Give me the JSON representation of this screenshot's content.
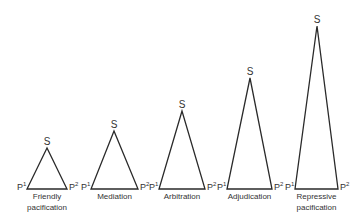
{
  "diagram": {
    "type": "triangle-series",
    "vertex_labels": {
      "apex": "S",
      "left": "P",
      "left_sup": "1",
      "right": "P",
      "right_sup": "2"
    },
    "triangles": [
      {
        "caption_line1": "Friendly",
        "caption_line2": "pacification",
        "apex": [
          47,
          148
        ],
        "left": [
          27,
          189
        ],
        "right": [
          67,
          189
        ]
      },
      {
        "caption_line1": "Mediation",
        "caption_line2": "",
        "apex": [
          114,
          131
        ],
        "left": [
          91,
          189
        ],
        "right": [
          138,
          189
        ]
      },
      {
        "caption_line1": "Arbitration",
        "caption_line2": "",
        "apex": [
          182,
          111
        ],
        "left": [
          159,
          189
        ],
        "right": [
          205,
          189
        ]
      },
      {
        "caption_line1": "Adjudication",
        "caption_line2": "",
        "apex": [
          250,
          78
        ],
        "left": [
          227,
          189
        ],
        "right": [
          272,
          189
        ]
      },
      {
        "caption_line1": "Repressive",
        "caption_line2": "pacification",
        "apex": [
          317,
          26
        ],
        "left": [
          295,
          189
        ],
        "right": [
          338,
          189
        ]
      }
    ]
  }
}
